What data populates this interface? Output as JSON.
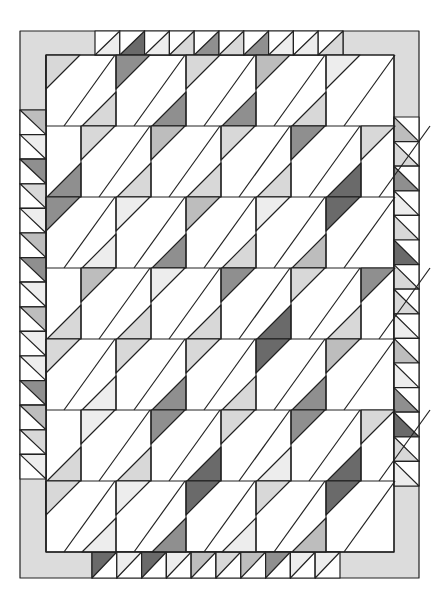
{
  "diagram": {
    "title": "",
    "palette": {
      "0": "#ffffff",
      "1": "#ededed",
      "2": "#d8d8d8",
      "3": "#bdbdbd",
      "4": "#8f8f8f",
      "5": "#6a6a6a",
      "line": "#222222",
      "bar": "#dcdcdc"
    },
    "frame": {
      "left": 20,
      "top": 31,
      "right": 419,
      "bottom": 578
    },
    "field": {
      "left": 46,
      "top": 55,
      "right": 394,
      "bottom": 552
    },
    "rows": {
      "tops": [
        55,
        126,
        197,
        268,
        339,
        410,
        481,
        552
      ],
      "col_width": 70,
      "tri": 34,
      "even_verticals": [
        116,
        186,
        256,
        326
      ],
      "odd_verticals": [
        81,
        151,
        221,
        291,
        361
      ]
    },
    "row_shades": [
      {
        "top": [
          2,
          4,
          2,
          3,
          1
        ],
        "bottom": [
          0,
          2,
          4,
          4,
          2
        ]
      },
      {
        "top": [
          2,
          3,
          2,
          4,
          2
        ],
        "bottom": [
          4,
          2,
          2,
          2,
          5
        ]
      },
      {
        "top": [
          4,
          1,
          3,
          1,
          5
        ],
        "bottom": [
          4,
          1,
          4,
          2,
          3
        ]
      },
      {
        "top": [
          3,
          1,
          4,
          2,
          4
        ],
        "bottom": [
          2,
          2,
          2,
          5,
          2
        ]
      },
      {
        "top": [
          2,
          2,
          2,
          5,
          3
        ],
        "bottom": [
          0,
          1,
          4,
          2,
          4
        ]
      },
      {
        "top": [
          1,
          4,
          2,
          4,
          2
        ],
        "bottom": [
          2,
          2,
          5,
          1,
          5
        ]
      },
      {
        "top": [
          2,
          1,
          5,
          2,
          5
        ],
        "bottom": [
          5,
          1,
          4,
          1,
          3
        ]
      }
    ],
    "border": {
      "top_triangles": [
        1,
        5,
        1,
        2,
        4,
        2,
        4,
        1,
        1,
        2
      ],
      "bottom_triangles": [
        5,
        1,
        5,
        1,
        3,
        2,
        3,
        4,
        1,
        1
      ],
      "left_triangles": [
        3,
        1,
        4,
        2,
        1,
        3,
        4,
        1,
        3,
        1,
        1,
        4,
        3,
        2,
        1,
        2,
        3,
        2,
        1,
        1
      ],
      "right_triangles": [
        3,
        2,
        4,
        1,
        2,
        5,
        2,
        2,
        1,
        3,
        1,
        4,
        5,
        2,
        1,
        1,
        3,
        2
      ]
    }
  }
}
